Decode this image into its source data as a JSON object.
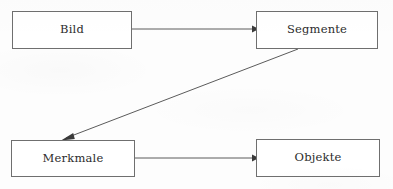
{
  "diagram": {
    "background_color": "#fdfdfd",
    "line_color": "#5b5b5b",
    "border_color": "#6f6f6f",
    "text_color": "#2b2b2b",
    "nodes": [
      {
        "id": "bild",
        "label": "Bild",
        "x": 12,
        "y": 11,
        "width": 120,
        "height": 38
      },
      {
        "id": "segmente",
        "label": "Segmente",
        "x": 256,
        "y": 11,
        "width": 122,
        "height": 38
      },
      {
        "id": "merkmale",
        "label": "Merkmale",
        "x": 11,
        "y": 140,
        "width": 124,
        "height": 37
      },
      {
        "id": "objekte",
        "label": "Objekte",
        "x": 256,
        "y": 139,
        "width": 124,
        "height": 38
      }
    ],
    "edges": [
      {
        "id": "bild-to-segmente",
        "from": "bild",
        "to": "segmente",
        "label": "",
        "direction": "right",
        "points": "132,29 252,29",
        "head": "252,25.4 259,29 252,32.6"
      },
      {
        "id": "segmente-to-merkmale",
        "from": "segmente",
        "to": "merkmale",
        "label": "",
        "direction": "diagonal-down-left",
        "points": "298,49 66,138",
        "head": "73.2,133.0 61.0,140.4 74.8,139.0"
      },
      {
        "id": "merkmale-to-objekte",
        "from": "merkmale",
        "to": "objekte",
        "label": "",
        "direction": "right",
        "points": "135,158 252,158",
        "head": "252,154.4 259,158 252,161.6"
      }
    ]
  }
}
